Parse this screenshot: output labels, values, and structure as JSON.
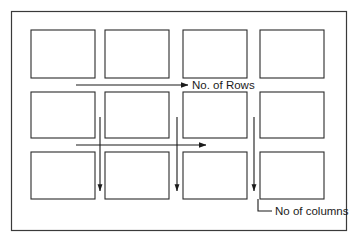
{
  "figure": {
    "background_color": "#ffffff",
    "stroke_color": "#2b2b2b",
    "text_color": "#1b1b1b",
    "outer_frame": {
      "x": 11,
      "y": 11,
      "width": 336,
      "height": 220
    },
    "grid": {
      "rows": 3,
      "columns": 4,
      "cell_width": 64,
      "cell_height": 48,
      "column_x": [
        31,
        105,
        183,
        260
      ],
      "row_y": [
        30,
        92,
        152
      ],
      "cells": [
        {
          "row": 1,
          "column": 1,
          "label": ""
        },
        {
          "row": 1,
          "column": 2,
          "label": ""
        },
        {
          "row": 1,
          "column": 3,
          "label": ""
        },
        {
          "row": 1,
          "column": 4,
          "label": ""
        },
        {
          "row": 2,
          "column": 1,
          "label": ""
        },
        {
          "row": 2,
          "column": 2,
          "label": ""
        },
        {
          "row": 2,
          "column": 3,
          "label": ""
        },
        {
          "row": 2,
          "column": 4,
          "label": ""
        },
        {
          "row": 3,
          "column": 1,
          "label": ""
        },
        {
          "row": 3,
          "column": 2,
          "label": ""
        },
        {
          "row": 3,
          "column": 3,
          "label": ""
        },
        {
          "row": 3,
          "column": 4,
          "label": ""
        }
      ]
    },
    "annotations": {
      "rows_label": "No. of Rows",
      "columns_label": "No of columns"
    },
    "arrows": {
      "horizontal": [
        {
          "name": "rows-arrow-top",
          "x1": 76,
          "y1": 85,
          "x2": 188,
          "y2": 85,
          "direction": "right"
        },
        {
          "name": "rows-arrow-middle",
          "x1": 76,
          "y1": 145,
          "x2": 206,
          "y2": 145,
          "direction": "right"
        }
      ],
      "vertical": [
        {
          "name": "columns-arrow-1",
          "x1": 100,
          "y1": 117,
          "x2": 100,
          "y2": 191,
          "direction": "down"
        },
        {
          "name": "columns-arrow-2",
          "x1": 177,
          "y1": 117,
          "x2": 177,
          "y2": 191,
          "direction": "down"
        },
        {
          "name": "columns-arrow-3",
          "x1": 254,
          "y1": 117,
          "x2": 254,
          "y2": 191,
          "direction": "down"
        }
      ]
    },
    "leader_line": {
      "name": "columns-leader-line",
      "vertical_x": 258,
      "vertical_y1": 199,
      "vertical_y2": 211,
      "horizontal_x2": 272,
      "horizontal_y": 211
    }
  }
}
